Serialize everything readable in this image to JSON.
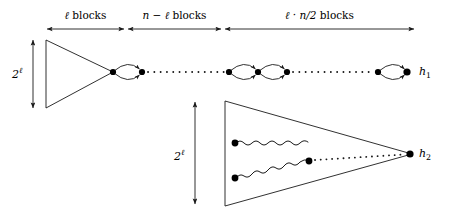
{
  "figure": {
    "type": "diagram",
    "stroke_color": "#1a1a1a",
    "node_color": "#000000",
    "background_color": "#ffffff",
    "axis": {
      "name": "blocks-axis",
      "segments": [
        {
          "id": "segment-1",
          "label_plain": "ℓ blocks",
          "var": "ℓ",
          "word": "blocks",
          "x_start": 46,
          "x_end": 125
        },
        {
          "id": "segment-2",
          "label_plain": "n − ℓ blocks",
          "var": "n − ℓ",
          "word": "blocks",
          "x_start": 127,
          "x_end": 222
        },
        {
          "id": "segment-3",
          "label_plain": "ℓ · n/2 blocks",
          "var": "ℓ · n/2",
          "word": "blocks",
          "x_start": 224,
          "x_end": 415
        }
      ],
      "axis_y": 29
    },
    "vertical_measures": [
      {
        "id": "height-upper",
        "label_base": "2",
        "label_exponent": "ℓ",
        "label_plain": "2^ℓ",
        "x": 33,
        "y_top": 38,
        "y_bottom": 110
      },
      {
        "id": "height-lower",
        "label_base": "2",
        "label_exponent": "ℓ",
        "label_plain": "2^ℓ",
        "x": 195,
        "y_top": 100,
        "y_bottom": 205
      }
    ],
    "outputs": [
      {
        "id": "output-h1",
        "label_base": "h",
        "label_subscript": "1",
        "label_plain": "h₁",
        "x": 424,
        "y": 72
      },
      {
        "id": "output-h2",
        "label_base": "h",
        "label_subscript": "2",
        "label_plain": "h₂",
        "x": 424,
        "y": 154
      }
    ],
    "upper_triangle": {
      "id": "upper-triangle",
      "left_x": 46,
      "top_y": 40,
      "bottom_y": 108,
      "apex_x": 113,
      "apex_y": 72
    },
    "lower_triangle": {
      "id": "lower-triangle",
      "left_x": 225,
      "top_y": 101,
      "bottom_y": 206,
      "apex_x": 412,
      "apex_y": 154
    },
    "bigon_chain": {
      "id": "bigon-chain",
      "row_y": 72,
      "nodes_x": [
        113,
        142,
        171,
        229,
        258,
        287,
        378,
        407
      ],
      "bigons": [
        {
          "x_left": 113,
          "x_right": 142
        },
        {
          "x_left": 229,
          "x_right": 258
        },
        {
          "x_left": 258,
          "x_right": 287
        },
        {
          "x_left": 378,
          "x_right": 407
        }
      ],
      "dotted_gaps": [
        {
          "x_start": 147,
          "x_end": 225
        },
        {
          "x_start": 292,
          "x_end": 374
        }
      ]
    },
    "wavy_paths": {
      "id": "wavy-paths",
      "source_nodes": [
        {
          "x": 235,
          "y": 143
        },
        {
          "x": 235,
          "y": 178
        }
      ],
      "join_node": {
        "x": 308,
        "y": 161
      },
      "dotted_to_apex": {
        "x_start": 314,
        "x_end": 406,
        "y_start": 160,
        "y_end": 154
      }
    }
  }
}
